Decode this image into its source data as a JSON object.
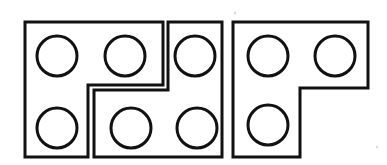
{
  "figure": {
    "background_color": "#ffffff",
    "stroke_color": "#111111",
    "fill_color": "#ffffff",
    "stroke_width": 3,
    "canvas": {
      "width": 387,
      "height": 165
    }
  },
  "pieces": [
    {
      "id": "piece-left",
      "name": "left-piece",
      "shape": "L-shaped-step",
      "description": "Left piece: tall rectangle on the left with a step notch cut into its lower right",
      "points": "25,22 163,22 163,85 88,85 88,157 25,157",
      "holes": [
        {
          "name": "hole-left-top-1",
          "cx": 57,
          "cy": 56,
          "r": 20
        },
        {
          "name": "hole-left-top-2",
          "cx": 125,
          "cy": 56,
          "r": 20
        },
        {
          "name": "hole-left-bottom-1",
          "cx": 57,
          "cy": 128,
          "r": 20
        }
      ]
    },
    {
      "id": "piece-middle",
      "name": "middle-piece",
      "shape": "reverse-L-step",
      "description": "Middle piece: narrow upper tab on the right side with a wide lower body reaching left",
      "points": "168,22 222,22 222,157 94,157 94,90 168,90",
      "holes": [
        {
          "name": "hole-middle-top-1",
          "cx": 195,
          "cy": 56,
          "r": 20
        },
        {
          "name": "hole-middle-bottom-1",
          "cx": 131,
          "cy": 128,
          "r": 20
        },
        {
          "name": "hole-middle-bottom-2",
          "cx": 197,
          "cy": 128,
          "r": 20
        }
      ]
    },
    {
      "id": "piece-right",
      "name": "right-piece",
      "shape": "L-shaped",
      "description": "Right piece: wide top bar with a downward leg on the left side",
      "points": "233,22 368,22 368,88 300,88 300,157 233,157",
      "holes": [
        {
          "name": "hole-right-top-1",
          "cx": 268,
          "cy": 56,
          "r": 20
        },
        {
          "name": "hole-right-top-2",
          "cx": 335,
          "cy": 56,
          "r": 20
        },
        {
          "name": "hole-right-bottom-1",
          "cx": 268,
          "cy": 125,
          "r": 20
        }
      ]
    }
  ],
  "specks": [
    {
      "name": "speck-top",
      "cx": 235,
      "cy": 13,
      "r": 1.2
    },
    {
      "name": "speck-right",
      "cx": 377,
      "cy": 147,
      "r": 1.2
    }
  ],
  "counts": {
    "piece_count": 3,
    "hole_count": 9
  }
}
